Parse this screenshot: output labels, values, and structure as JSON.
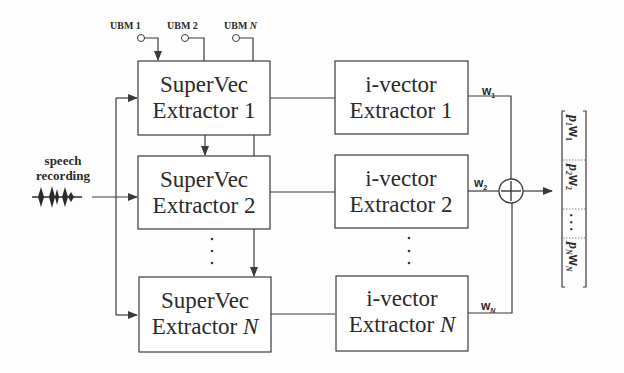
{
  "diagram": {
    "input": {
      "label_line1": "speech",
      "label_line2": "recording"
    },
    "ubms": [
      {
        "label": "UBM 1"
      },
      {
        "label": "UBM 2"
      },
      {
        "label": "UBM ",
        "italic_suffix": "N"
      }
    ],
    "supervec_extractors": [
      {
        "line1": "SuperVec",
        "line2": "Extractor 1",
        "italic_suffix": ""
      },
      {
        "line1": "SuperVec",
        "line2": "Extractor 2",
        "italic_suffix": ""
      },
      {
        "line1": "SuperVec",
        "line2": "Extractor ",
        "italic_suffix": "N"
      }
    ],
    "ivector_extractors": [
      {
        "line1": "i-vector",
        "line2": "Extractor 1",
        "italic_suffix": ""
      },
      {
        "line1": "i-vector",
        "line2": "Extractor 2",
        "italic_suffix": ""
      },
      {
        "line1": "i-vector",
        "line2": "Extractor ",
        "italic_suffix": "N"
      }
    ],
    "outputs": [
      {
        "label": "w",
        "sub": "1"
      },
      {
        "label": "w",
        "sub": "2"
      },
      {
        "label": "w",
        "sub": "N"
      }
    ],
    "combiner": {
      "symbol": "+"
    },
    "result_vector": [
      {
        "p": "p",
        "p_sub": "1",
        "w": "w",
        "w_sub": "1"
      },
      {
        "p": "p",
        "p_sub": "2",
        "w": "w",
        "w_sub": "2"
      },
      {
        "ellipsis": ". . ."
      },
      {
        "p": "p",
        "p_sub": "N",
        "w": "w",
        "w_sub": "N"
      }
    ],
    "ellipsis_vertical": "⋮"
  }
}
